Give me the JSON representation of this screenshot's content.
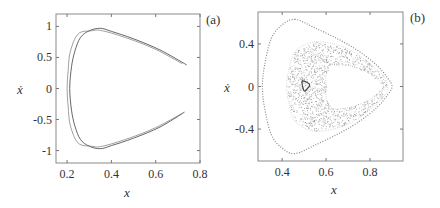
{
  "figure": {
    "panels": [
      {
        "id": "a",
        "label": "(a)",
        "xlabel": "x",
        "ylabel": "ẋ",
        "xticks": [
          {
            "v": 0.2,
            "t": "0.2"
          },
          {
            "v": 0.4,
            "t": "0.4"
          },
          {
            "v": 0.6,
            "t": "0.6"
          },
          {
            "v": 0.8,
            "t": "0.8"
          }
        ],
        "yticks": [
          {
            "v": 1,
            "t": "1"
          },
          {
            "v": 0.5,
            "t": "0.5"
          },
          {
            "v": 0,
            "t": "0"
          },
          {
            "v": -0.5,
            "t": "-0.5"
          },
          {
            "v": -1,
            "t": "-1"
          }
        ]
      },
      {
        "id": "b",
        "label": "(b)",
        "xlabel": "x",
        "ylabel": "ẋ",
        "xticks": [
          {
            "v": 0.4,
            "t": "0.4"
          },
          {
            "v": 0.6,
            "t": "0.6"
          },
          {
            "v": 0.8,
            "t": "0.8"
          }
        ],
        "yticks": [
          {
            "v": 0.4,
            "t": "0.4"
          },
          {
            "v": 0,
            "t": "0"
          },
          {
            "v": -0.4,
            "t": "-0.4"
          }
        ]
      }
    ]
  },
  "chart_data": [
    {
      "type": "scatter",
      "title": "(a)",
      "xlabel": "x",
      "ylabel": "ẋ",
      "xlim": [
        0.15,
        0.8
      ],
      "ylim": [
        -1.2,
        1.2
      ],
      "grid": false,
      "description": "Phase portrait: two nearly overlapping open curves forming a bow/arrowhead shape, left vertex near x=0.21, opening to the right toward x≈0.74",
      "series": [
        {
          "name": "trajectory-1",
          "points": [
            [
              0.74,
              0.38
            ],
            [
              0.62,
              0.62
            ],
            [
              0.5,
              0.8
            ],
            [
              0.4,
              0.92
            ],
            [
              0.35,
              0.97
            ],
            [
              0.3,
              0.93
            ],
            [
              0.26,
              0.82
            ],
            [
              0.235,
              0.6
            ],
            [
              0.22,
              0.35
            ],
            [
              0.212,
              0.0
            ],
            [
              0.22,
              -0.35
            ],
            [
              0.235,
              -0.6
            ],
            [
              0.26,
              -0.82
            ],
            [
              0.3,
              -0.93
            ],
            [
              0.35,
              -0.97
            ],
            [
              0.4,
              -0.92
            ],
            [
              0.5,
              -0.8
            ],
            [
              0.62,
              -0.62
            ],
            [
              0.73,
              -0.38
            ]
          ]
        },
        {
          "name": "trajectory-2",
          "points": [
            [
              0.72,
              0.4
            ],
            [
              0.6,
              0.63
            ],
            [
              0.48,
              0.8
            ],
            [
              0.36,
              0.93
            ],
            [
              0.31,
              0.93
            ],
            [
              0.25,
              0.88
            ],
            [
              0.215,
              0.6
            ],
            [
              0.205,
              0.3
            ],
            [
              0.2,
              0.0
            ],
            [
              0.205,
              -0.3
            ],
            [
              0.215,
              -0.6
            ],
            [
              0.25,
              -0.88
            ],
            [
              0.31,
              -0.93
            ],
            [
              0.36,
              -0.93
            ],
            [
              0.48,
              -0.8
            ],
            [
              0.6,
              -0.63
            ],
            [
              0.72,
              -0.4
            ]
          ]
        }
      ]
    },
    {
      "type": "scatter",
      "title": "(b)",
      "xlabel": "x",
      "ylabel": "ẋ",
      "xlim": [
        0.29,
        0.95
      ],
      "ylim": [
        -0.7,
        0.7
      ],
      "grid": false,
      "description": "Poincaré-like section: outer closed rounded-triangle orbit, inner chaotic band forming a horseshoe around an empty region, small triangular loop near (0.5, 0)",
      "series": [
        {
          "name": "outer-orbit",
          "points": [
            [
              0.46,
              0.63
            ],
            [
              0.4,
              0.58
            ],
            [
              0.35,
              0.45
            ],
            [
              0.32,
              0.2
            ],
            [
              0.31,
              0.0
            ],
            [
              0.32,
              -0.2
            ],
            [
              0.35,
              -0.45
            ],
            [
              0.4,
              -0.58
            ],
            [
              0.46,
              -0.63
            ],
            [
              0.55,
              -0.55
            ],
            [
              0.66,
              -0.44
            ],
            [
              0.75,
              -0.33
            ],
            [
              0.83,
              -0.2
            ],
            [
              0.88,
              -0.08
            ],
            [
              0.9,
              0.0
            ],
            [
              0.88,
              0.08
            ],
            [
              0.83,
              0.2
            ],
            [
              0.75,
              0.33
            ],
            [
              0.66,
              0.44
            ],
            [
              0.55,
              0.55
            ]
          ]
        },
        {
          "name": "chaotic-band",
          "outer_boundary": [
            [
              0.55,
              0.42
            ],
            [
              0.46,
              0.33
            ],
            [
              0.43,
              0.15
            ],
            [
              0.42,
              0.0
            ],
            [
              0.43,
              -0.15
            ],
            [
              0.46,
              -0.33
            ],
            [
              0.55,
              -0.42
            ],
            [
              0.68,
              -0.37
            ],
            [
              0.78,
              -0.25
            ],
            [
              0.86,
              -0.1
            ],
            [
              0.88,
              0.0
            ],
            [
              0.86,
              0.1
            ],
            [
              0.78,
              0.25
            ],
            [
              0.68,
              0.37
            ]
          ],
          "inner_boundary": [
            [
              0.62,
              0.2
            ],
            [
              0.6,
              0.1
            ],
            [
              0.6,
              0.0
            ],
            [
              0.6,
              -0.1
            ],
            [
              0.62,
              -0.2
            ],
            [
              0.7,
              -0.2
            ],
            [
              0.8,
              -0.12
            ],
            [
              0.86,
              0.0
            ],
            [
              0.8,
              0.12
            ],
            [
              0.7,
              0.2
            ]
          ]
        },
        {
          "name": "small-loop",
          "points": [
            [
              0.49,
              0.04
            ],
            [
              0.5,
              -0.04
            ],
            [
              0.515,
              -0.02
            ],
            [
              0.525,
              0.02
            ],
            [
              0.5,
              0.05
            ]
          ]
        }
      ]
    }
  ]
}
